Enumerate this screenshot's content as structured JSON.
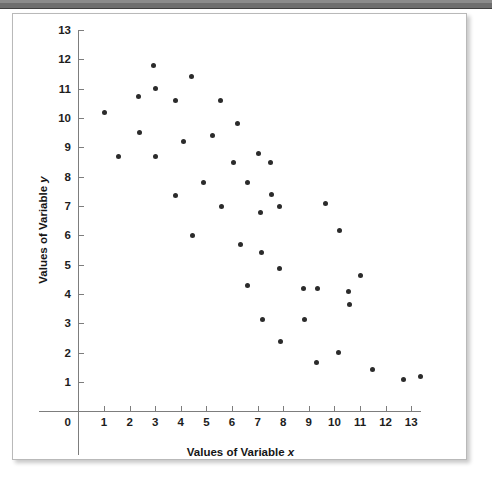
{
  "figure": {
    "background_color": "#ffffff",
    "border_color": "#b9b9b9",
    "top_bar_color": "#6e6e6e",
    "point_color": "#2b2b2b",
    "axis_color": "#7d7d7d",
    "text_color": "#1d1d1d"
  },
  "chart_data": {
    "type": "scatter",
    "title": "",
    "xlabel_parts": {
      "prefix": "Values of Variable ",
      "variable": "x"
    },
    "ylabel_parts": {
      "prefix": "Values of Variable ",
      "variable": "y"
    },
    "xlabel": "Values of Variable x",
    "ylabel": "Values of Variable y",
    "xlim": [
      0,
      13.8
    ],
    "ylim": [
      0,
      13
    ],
    "x_ticks": [
      1,
      2,
      3,
      4,
      5,
      6,
      7,
      8,
      9,
      10,
      11,
      12,
      13
    ],
    "y_ticks": [
      1,
      2,
      3,
      4,
      5,
      6,
      7,
      8,
      9,
      10,
      11,
      12,
      13
    ],
    "x_tick_labels": [
      "1",
      "2",
      "3",
      "4",
      "5",
      "6",
      "7",
      "8",
      "9",
      "10",
      "11",
      "12",
      "13"
    ],
    "y_tick_labels": [
      "1",
      "2",
      "3",
      "4",
      "5",
      "6",
      "7",
      "8",
      "9",
      "10",
      "11",
      "12",
      "13"
    ],
    "origin_label": "0",
    "grid": false,
    "legend": false,
    "marker": "circle",
    "marker_size": 5,
    "points": [
      [
        1.0,
        10.2
      ],
      [
        1.55,
        8.7
      ],
      [
        2.35,
        10.75
      ],
      [
        2.4,
        9.5
      ],
      [
        2.95,
        11.8
      ],
      [
        3.0,
        11.0
      ],
      [
        3.0,
        8.7
      ],
      [
        3.8,
        10.6
      ],
      [
        3.8,
        7.35
      ],
      [
        4.1,
        9.2
      ],
      [
        4.4,
        11.4
      ],
      [
        4.45,
        6.0
      ],
      [
        4.9,
        7.8
      ],
      [
        5.25,
        9.4
      ],
      [
        5.55,
        10.6
      ],
      [
        5.6,
        7.0
      ],
      [
        6.05,
        8.5
      ],
      [
        6.2,
        9.8
      ],
      [
        6.35,
        5.7
      ],
      [
        6.6,
        7.8
      ],
      [
        6.6,
        4.28
      ],
      [
        7.05,
        8.8
      ],
      [
        7.1,
        6.78
      ],
      [
        7.15,
        5.4
      ],
      [
        7.2,
        3.12
      ],
      [
        7.5,
        8.5
      ],
      [
        7.55,
        7.4
      ],
      [
        7.85,
        7.0
      ],
      [
        7.85,
        4.88
      ],
      [
        7.9,
        2.38
      ],
      [
        8.8,
        4.18
      ],
      [
        8.85,
        3.12
      ],
      [
        9.3,
        1.68
      ],
      [
        9.35,
        4.18
      ],
      [
        9.65,
        7.1
      ],
      [
        10.15,
        2.0
      ],
      [
        10.2,
        6.18
      ],
      [
        10.55,
        4.1
      ],
      [
        10.6,
        3.65
      ],
      [
        11.0,
        4.62
      ],
      [
        11.5,
        1.42
      ],
      [
        12.7,
        1.08
      ],
      [
        13.35,
        1.18
      ]
    ]
  }
}
